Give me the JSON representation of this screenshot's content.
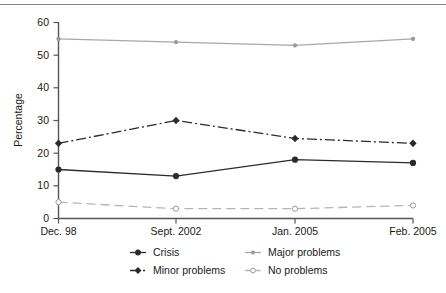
{
  "chart_data": {
    "type": "line",
    "title": "",
    "xlabel": "",
    "ylabel": "Percentage",
    "categories": [
      "Dec. 98",
      "Sept. 2002",
      "Jan. 2005",
      "Feb. 2005"
    ],
    "yticks": [
      0,
      10,
      20,
      30,
      40,
      50,
      60
    ],
    "ylim": [
      0,
      60
    ],
    "grid": false,
    "legend_position": "bottom",
    "series": [
      {
        "name": "Crisis",
        "values": [
          15,
          13,
          18,
          17
        ],
        "color": "#2b2b2b",
        "line_style": "solid",
        "marker": "filled-circle"
      },
      {
        "name": "Minor problems",
        "values": [
          23,
          30,
          24.5,
          23
        ],
        "color": "#2b2b2b",
        "line_style": "dash-dot",
        "marker": "filled-diamond"
      },
      {
        "name": "Major problems",
        "values": [
          55,
          54,
          53,
          55
        ],
        "color": "#a8a8a8",
        "line_style": "solid",
        "marker": "small-dot"
      },
      {
        "name": "No problems",
        "values": [
          5,
          3,
          3,
          4
        ],
        "color": "#b5b5b5",
        "line_style": "long-dash",
        "marker": "open-circle"
      }
    ]
  },
  "yaxis": {
    "title": "Percentage",
    "t0": "0",
    "t10": "10",
    "t20": "20",
    "t30": "30",
    "t40": "40",
    "t50": "50",
    "t60": "60"
  },
  "xaxis": {
    "c0": "Dec. 98",
    "c1": "Sept. 2002",
    "c2": "Jan. 2005",
    "c3": "Feb. 2005"
  },
  "legend": {
    "crisis": "Crisis",
    "major": "Major problems",
    "minor": "Minor problems",
    "noproblems": "No problems"
  }
}
